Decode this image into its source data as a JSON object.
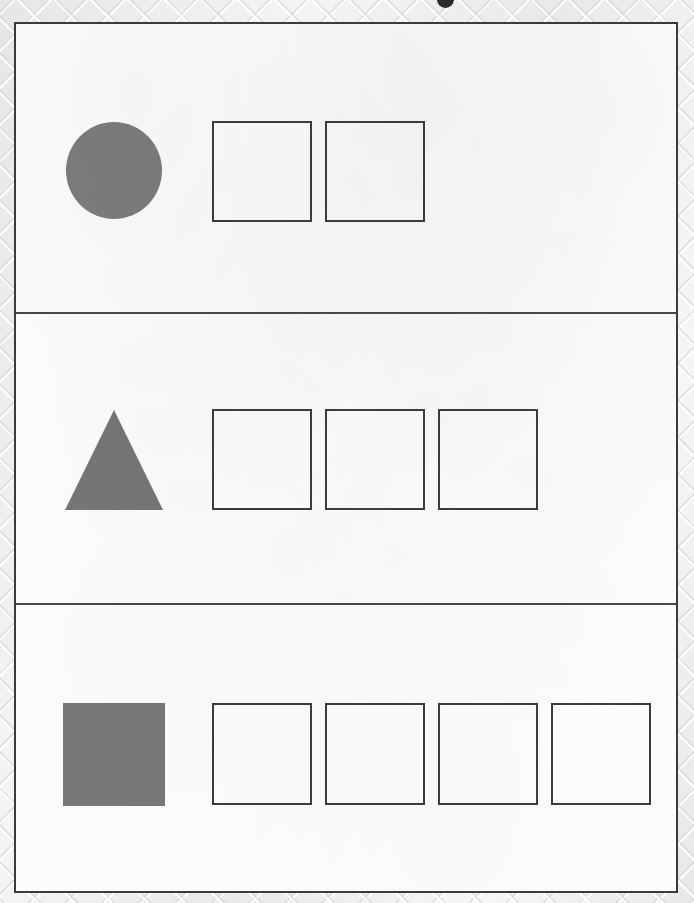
{
  "page": {
    "background_texture": "diagonal-crosshatch-paper",
    "sheet_color": "#fdfdfd",
    "border_color": "#3b3b3f",
    "artifact": {
      "name": "ink-mark",
      "description": "partial dark round ink mark clipped at top page edge"
    }
  },
  "worksheet": {
    "title": "",
    "shape_fill_color": "#7d7d80",
    "box_border_color": "#3d3d41",
    "rows": [
      {
        "id": "row-1",
        "shape": "circle",
        "shape_label": "circle",
        "box_count": 2,
        "boxes": [
          "",
          ""
        ]
      },
      {
        "id": "row-2",
        "shape": "triangle",
        "shape_label": "triangle",
        "box_count": 3,
        "boxes": [
          "",
          "",
          ""
        ]
      },
      {
        "id": "row-3",
        "shape": "square",
        "shape_label": "square",
        "box_count": 4,
        "boxes": [
          "",
          "",
          "",
          ""
        ]
      }
    ]
  }
}
